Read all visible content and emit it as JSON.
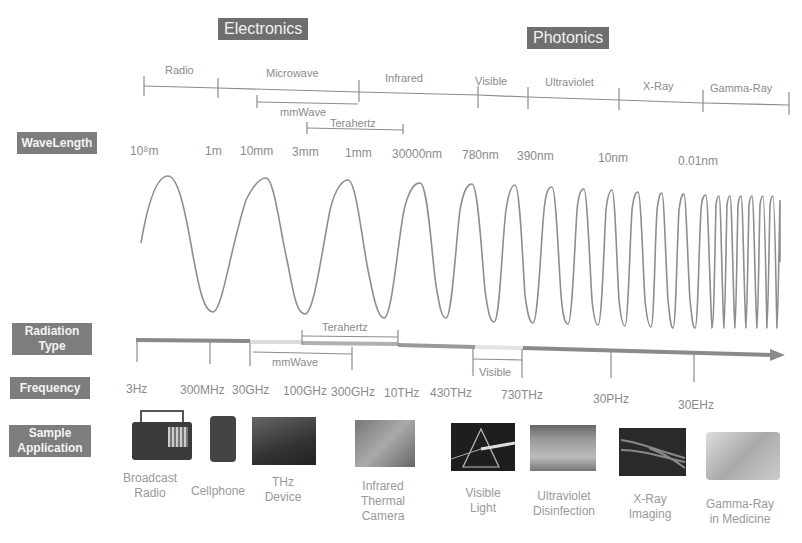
{
  "headers": {
    "electronics": "Electronics",
    "photonics": "Photonics"
  },
  "row_tags": {
    "wavelength": "WaveLength",
    "radiation_type": "Radiation Type",
    "frequency": "Frequency",
    "sample_application": "Sample Application"
  },
  "bands": [
    {
      "label": "Radio"
    },
    {
      "label": "Microwave"
    },
    {
      "label": "Infrared"
    },
    {
      "label": "Visible"
    },
    {
      "label": "Ultraviolet"
    },
    {
      "label": "X-Ray"
    },
    {
      "label": "Gamma-Ray"
    }
  ],
  "sub_bands_top": {
    "mmwave": "mmWave",
    "terahertz": "Terahertz"
  },
  "wavelengths": [
    "10⁸m",
    "1m",
    "10mm",
    "3mm",
    "1mm",
    "30000nm",
    "780nm",
    "390nm",
    "10nm",
    "0.01nm"
  ],
  "radiation_sub_bands": {
    "terahertz": "Terahertz",
    "mmwave": "mmWave",
    "visible": "Visible"
  },
  "frequencies": [
    "3Hz",
    "300MHz",
    "30GHz",
    "100GHz",
    "300GHz",
    "10THz",
    "430THz",
    "730THz",
    "30PHz",
    "30EHz"
  ],
  "applications": [
    {
      "label": "Broadcast Radio",
      "line1": "Broadcast",
      "line2": "Radio",
      "icon": "radio-icon"
    },
    {
      "label": "Cellphone",
      "line1": "Cellphone",
      "line2": "",
      "icon": "cellphone-icon"
    },
    {
      "label": "THz Device",
      "line1": "THz",
      "line2": "Device",
      "icon": "thz-device-image"
    },
    {
      "label": "Infrared Thermal Camera",
      "line1": "Infrared",
      "line2": "Thermal",
      "line3": "Camera",
      "icon": "thermal-camera-image"
    },
    {
      "label": "Visible Light",
      "line1": "Visible",
      "line2": "Light",
      "icon": "prism-image"
    },
    {
      "label": "Ultraviolet Disinfection",
      "line1": "Ultraviolet",
      "line2": "Disinfection",
      "icon": "uv-lamp-image"
    },
    {
      "label": "X-Ray Imaging",
      "line1": "X-Ray",
      "line2": "Imaging",
      "icon": "xray-hand-image"
    },
    {
      "label": "Gamma-Ray in Medicine",
      "line1": "Gamma-Ray",
      "line2": "in Medicine",
      "icon": "gamma-machine-image"
    }
  ],
  "colors": {
    "tag_bg": "#7d7d7d",
    "header_bg": "#6f6f6f",
    "line": "#8c8c8c",
    "text": "#8a8a8a"
  }
}
